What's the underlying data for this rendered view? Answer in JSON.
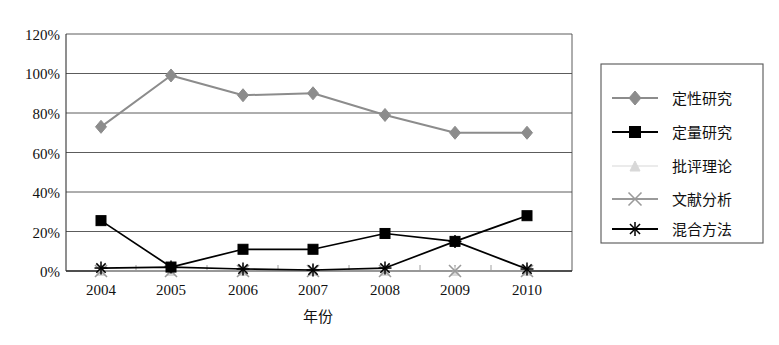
{
  "chart_data": {
    "type": "line",
    "title": "",
    "xlabel": "年份",
    "ylabel": "",
    "categories": [
      "2004",
      "2005",
      "2006",
      "2007",
      "2008",
      "2009",
      "2010"
    ],
    "x": [
      2004,
      2005,
      2006,
      2007,
      2008,
      2009,
      2010
    ],
    "ylim": [
      0,
      120
    ],
    "ytick_labels": [
      "0%",
      "20%",
      "40%",
      "60%",
      "80%",
      "100%",
      "120%"
    ],
    "ytick_values": [
      0,
      20,
      40,
      60,
      80,
      100,
      120
    ],
    "grid": true,
    "legend_position": "right",
    "series": [
      {
        "name": "定性研究",
        "marker": "diamond",
        "color": "#8c8c8c",
        "values": [
          73,
          99,
          89,
          90,
          79,
          70,
          70
        ]
      },
      {
        "name": "定量研究",
        "marker": "square",
        "color": "#000000",
        "values": [
          25.5,
          2,
          11,
          11,
          19,
          15,
          28
        ]
      },
      {
        "name": "批评理论",
        "marker": "triangle",
        "color": "#d8d8d8",
        "values": [
          0,
          0,
          0,
          0,
          0,
          0,
          0
        ]
      },
      {
        "name": "文献分析",
        "marker": "x",
        "color": "#9a9a9a",
        "values": [
          0,
          0,
          0,
          0,
          0,
          0,
          0
        ]
      },
      {
        "name": "混合方法",
        "marker": "asterisk",
        "color": "#000000",
        "values": [
          1.5,
          2,
          1,
          0.5,
          1.5,
          15,
          1
        ]
      }
    ]
  },
  "axes": {
    "ytick_0": "0%",
    "ytick_1": "20%",
    "ytick_2": "40%",
    "ytick_3": "60%",
    "ytick_4": "80%",
    "ytick_5": "100%",
    "ytick_6": "120%",
    "xtick_0": "2004",
    "xtick_1": "2005",
    "xtick_2": "2006",
    "xtick_3": "2007",
    "xtick_4": "2008",
    "xtick_5": "2009",
    "xtick_6": "2010",
    "xlabel": "年份"
  },
  "legend": {
    "items": [
      {
        "label": "定性研究"
      },
      {
        "label": "定量研究"
      },
      {
        "label": "批评理论"
      },
      {
        "label": "文献分析"
      },
      {
        "label": "混合方法"
      }
    ]
  },
  "colors": {
    "qualitative": "#8c8c8c",
    "quantitative": "#000000",
    "critical_theory": "#d8d8d8",
    "literature_analysis": "#9a9a9a",
    "mixed_methods": "#000000",
    "grid": "#4a4a4a",
    "axis": "#333333",
    "background": "#ffffff"
  }
}
